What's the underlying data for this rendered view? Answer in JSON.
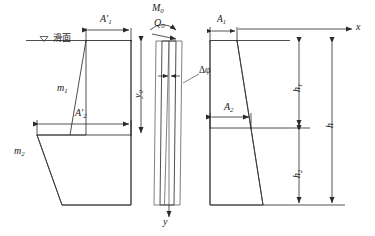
{
  "figure": {
    "type": "engineering-cross-section-diagram",
    "panels": [
      {
        "id": "left-section",
        "name": "pile-cross-section-left",
        "labels": {
          "slide_surface": "滑面",
          "slide_surface_marker": "triangle-down-icon",
          "width_top": "A",
          "width_top_prime": "′",
          "width_top_sub": "1",
          "width_mid": "A",
          "width_mid_prime": "′",
          "width_mid_sub": "2",
          "slope_upper": "m",
          "slope_upper_sub": "1",
          "slope_lower": "m",
          "slope_lower_sub": "2"
        }
      },
      {
        "id": "middle-deflection",
        "name": "pile-deflection-diagram",
        "labels": {
          "moment": "M",
          "moment_sub": "0",
          "shear": "Q",
          "shear_sub": "0",
          "rotation": "Δφ",
          "depth": "y",
          "depth_sub": "0",
          "axis_y": "y"
        }
      },
      {
        "id": "right-section",
        "name": "pile-cross-section-right",
        "labels": {
          "axis_x": "x",
          "width_top": "A",
          "width_top_sub": "1",
          "width_mid": "A",
          "width_mid_sub": "2",
          "height_upper": "h",
          "height_upper_sub": "1",
          "height_lower": "h",
          "height_lower_sub": "2",
          "height_total": "h"
        }
      }
    ],
    "colors": {
      "line": "#3a3a3a",
      "dimension": "#2a2a2a",
      "text": "#1a1a1a",
      "background": "#ffffff"
    }
  }
}
